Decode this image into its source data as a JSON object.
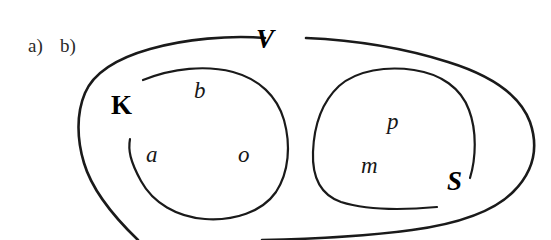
{
  "figure": {
    "width": 551,
    "height": 240,
    "background_color": "#ffffff",
    "stroke_color": "#1a1a1a",
    "type": "hand-drawn set / Venn style diagram"
  },
  "part_labels": [
    {
      "id": "a",
      "text": "a)",
      "x": 28,
      "y": 36
    },
    {
      "id": "b",
      "text": "b)",
      "x": 60,
      "y": 36
    }
  ],
  "sets": {
    "universe": {
      "label": "V",
      "label_x": 256,
      "label_y": 26,
      "style": "bold-italic"
    },
    "left": {
      "label": "K",
      "label_x": 111,
      "label_y": 92,
      "style": "bold-upright",
      "members": [
        {
          "text": "b",
          "x": 194,
          "y": 79
        },
        {
          "text": "a",
          "x": 146,
          "y": 143
        },
        {
          "text": "o",
          "x": 238,
          "y": 143
        }
      ]
    },
    "right": {
      "label": "S",
      "label_x": 447,
      "label_y": 168,
      "style": "bold-italic",
      "members": [
        {
          "text": "p",
          "x": 387,
          "y": 110
        },
        {
          "text": "m",
          "x": 361,
          "y": 154
        }
      ]
    }
  },
  "curves": {
    "universe_left_arc": "M 265 38 C 230 35 185 39 150 49 C 118 58 94 72 85 93 C 76 114 77 140 84 163 C 92 190 112 215 138 240",
    "universe_right_arc": "M 306 38 C 352 40 404 48 448 62 C 490 75 520 95 530 122 C 539 148 533 172 513 192 C 492 213 456 224 412 230 C 368 236 312 239 262 240",
    "left_blob": "M 143 80 C 173 68 206 65 233 72 C 259 79 277 96 284 120 C 291 145 289 172 276 192 C 262 212 234 221 205 219 C 177 217 153 203 141 181 C 130 161 128 150 130 139",
    "right_blob": "M 437 207 C 404 210 366 210 341 202 C 321 195 312 178 313 152 C 314 126 322 102 339 86 C 357 70 387 66 414 70 C 441 74 461 88 469 110 C 477 131 476 158 470 178"
  }
}
